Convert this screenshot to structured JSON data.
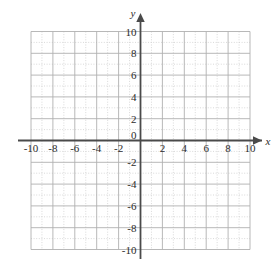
{
  "figure": {
    "kind": "cartesian-coordinate-plane",
    "background_color": "#ffffff",
    "axis_color": "#4a4a4a",
    "major_grid_color": "#b0b0b0",
    "minor_grid_color": "#cfcfcf",
    "label_color": "#2b2b2b"
  },
  "axes": {
    "x_name": "x",
    "y_name": "y",
    "origin_label": "0"
  },
  "chart_data": {
    "type": "scatter",
    "title": "",
    "subtitle": "",
    "xlabel": "x",
    "ylabel": "y",
    "xlim": [
      -10,
      10
    ],
    "ylim": [
      -10,
      10
    ],
    "grid": true,
    "minor_grid_step": 1,
    "major_grid_step": 2,
    "tick_step": 2,
    "legend": null,
    "legend_position": "none",
    "annotations": [],
    "series": [],
    "x_tick_labels": [
      "-10",
      "-8",
      "-6",
      "-4",
      "-2",
      "0",
      "2",
      "4",
      "6",
      "8",
      "10"
    ],
    "x_tick_values": [
      -10,
      -8,
      -6,
      -4,
      -2,
      0,
      2,
      4,
      6,
      8,
      10
    ],
    "y_tick_labels": [
      "10",
      "8",
      "6",
      "4",
      "2",
      "-2",
      "-4",
      "-6",
      "-8",
      "-10"
    ],
    "y_tick_values": [
      10,
      8,
      6,
      4,
      2,
      -2,
      -4,
      -6,
      -8,
      -10
    ]
  }
}
